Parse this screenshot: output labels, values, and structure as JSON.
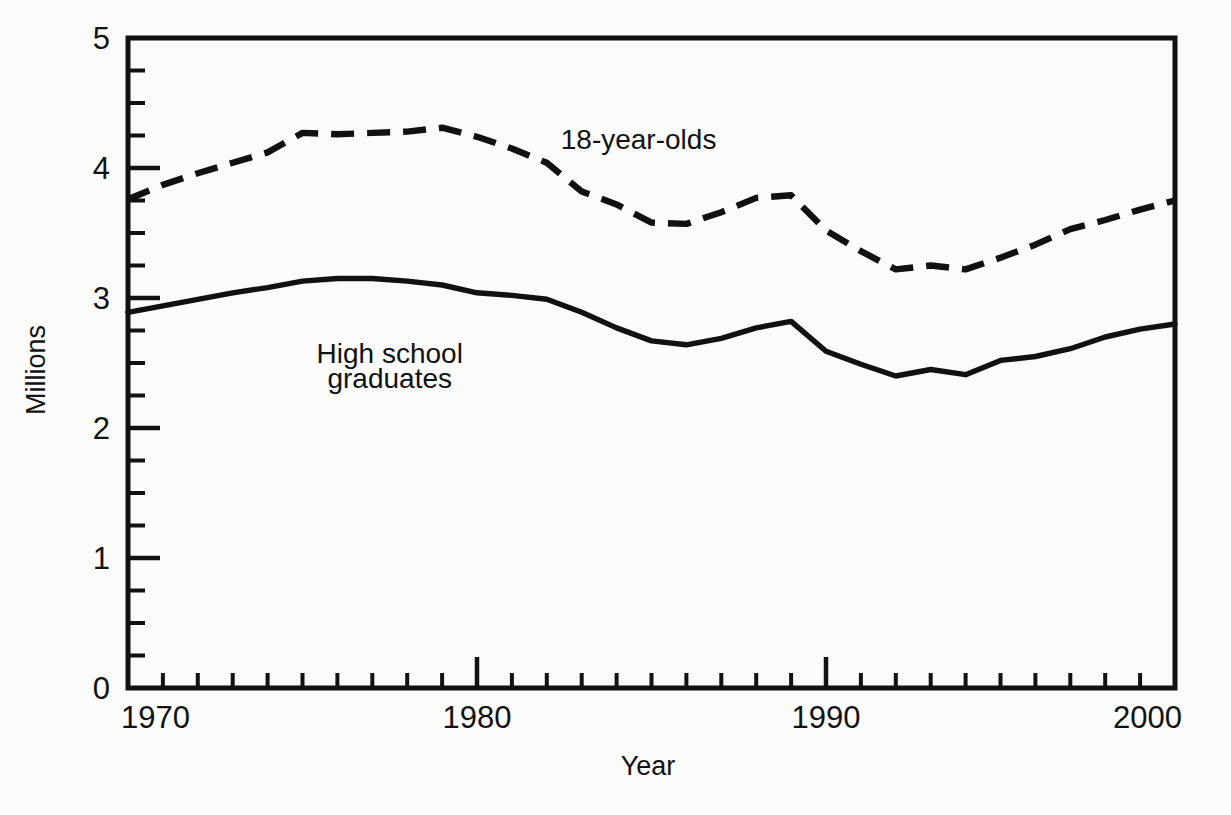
{
  "chart_data": {
    "type": "line",
    "title": "",
    "xlabel": "Year",
    "ylabel": "Millions",
    "xlim": [
      1970,
      2000
    ],
    "ylim": [
      0,
      5
    ],
    "grid": false,
    "legend_position": "inline-annotation",
    "x_tick_labels": [
      "1970",
      "1980",
      "1990",
      "2000"
    ],
    "x_tick_values": [
      1970,
      1980,
      1990,
      2000
    ],
    "x_minor_tick_step": 1,
    "y_tick_labels": [
      "0",
      "1",
      "2",
      "3",
      "4",
      "5"
    ],
    "y_tick_values": [
      0,
      1,
      2,
      3,
      4,
      5
    ],
    "y_minor_tick_step": 0.25,
    "x": [
      1970,
      1971,
      1972,
      1973,
      1974,
      1975,
      1976,
      1977,
      1978,
      1979,
      1980,
      1981,
      1982,
      1983,
      1984,
      1985,
      1986,
      1987,
      1988,
      1989,
      1990,
      1991,
      1992,
      1993,
      1994,
      1995,
      1996,
      1997,
      1998,
      1999,
      2000
    ],
    "series": [
      {
        "name": "18-year-olds",
        "style": "dashed",
        "label_text": "18-year-olds",
        "values": [
          3.76,
          3.87,
          3.96,
          4.04,
          4.12,
          4.27,
          4.26,
          4.27,
          4.28,
          4.31,
          4.24,
          4.15,
          4.04,
          3.82,
          3.72,
          3.58,
          3.57,
          3.66,
          3.77,
          3.79,
          3.52,
          3.36,
          3.22,
          3.25,
          3.22,
          3.31,
          3.41,
          3.53,
          3.6,
          3.68,
          3.75
        ]
      },
      {
        "name": "High school graduates",
        "style": "solid",
        "label_text_line1": "High school",
        "label_text_line2": "graduates",
        "values": [
          2.89,
          2.94,
          2.99,
          3.04,
          3.08,
          3.13,
          3.15,
          3.15,
          3.13,
          3.1,
          3.04,
          3.02,
          2.99,
          2.89,
          2.77,
          2.67,
          2.64,
          2.69,
          2.77,
          2.82,
          2.59,
          2.49,
          2.4,
          2.45,
          2.41,
          2.52,
          2.55,
          2.61,
          2.7,
          2.76,
          2.8
        ]
      }
    ],
    "annotations": [
      {
        "text": "18-year-olds",
        "x": 1982.4,
        "y": 4.15
      },
      {
        "text": "High school",
        "x": 1977.5,
        "y": 2.5
      },
      {
        "text": "graduates",
        "x": 1977.5,
        "y": 2.31
      }
    ],
    "colors": {
      "line": "#111111",
      "axis": "#111111",
      "background": "#fbfbfa",
      "text": "#121212"
    }
  }
}
